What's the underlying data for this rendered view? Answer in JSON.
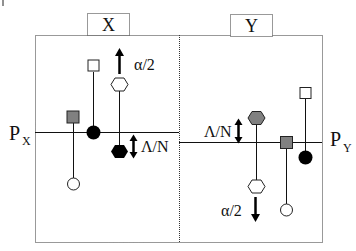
{
  "diagram": {
    "panels": [
      {
        "id": "X",
        "label": "X",
        "level_label": "P",
        "level_subscript": "X"
      },
      {
        "id": "Y",
        "label": "Y",
        "level_label": "P",
        "level_subscript": "Y"
      }
    ],
    "annotations": {
      "x_alpha": "α/2",
      "x_lambda": "Λ/N",
      "y_lambda": "Λ/N",
      "y_alpha": "α/2"
    },
    "colors": {
      "line": "#111111",
      "gray_fill": "#808080",
      "black_fill": "#000000",
      "white_fill": "#ffffff",
      "dotted_border": "#333333"
    }
  }
}
